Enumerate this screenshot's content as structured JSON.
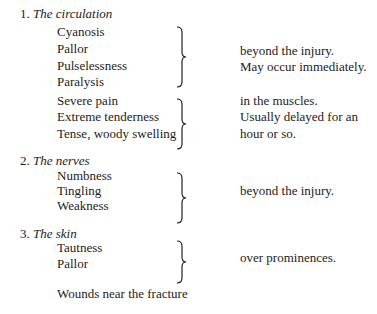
{
  "sections": [
    {
      "number": "1.",
      "title": "The circulation",
      "groups": [
        {
          "items": [
            "Cyanosis",
            "Pallor",
            "Pulselessness",
            "Paralysis"
          ],
          "notes": [
            "beyond the injury.",
            "May occur immediately."
          ]
        },
        {
          "items": [
            "Severe pain",
            "Extreme tenderness",
            "Tense, woody swelling"
          ],
          "notes": [
            "in the muscles.",
            "Usually delayed for an",
            "hour or so."
          ]
        }
      ]
    },
    {
      "number": "2.",
      "title": "The nerves",
      "groups": [
        {
          "items": [
            "Numbness",
            "Tingling",
            "Weakness"
          ],
          "notes": [
            "beyond the injury."
          ]
        }
      ]
    },
    {
      "number": "3.",
      "title": "The skin",
      "groups": [
        {
          "items": [
            "Tautness",
            "Pallor"
          ],
          "notes": [
            "over prominences."
          ]
        }
      ],
      "extra": "Wounds near the fracture"
    }
  ]
}
